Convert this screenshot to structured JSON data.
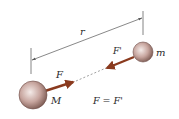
{
  "diagram": {
    "labels": {
      "distance": "r",
      "large_mass": "M",
      "small_mass": "m",
      "force_on_M": "F",
      "force_on_m": "F'",
      "equation": "F = F'"
    },
    "colors": {
      "sphere_fill": "#b08a82",
      "sphere_highlight": "#f4ebe8",
      "sphere_edge": "#6e4e48",
      "arrow": "#8a3a1e",
      "dimension_line": "#555555",
      "text": "#2a2a2a"
    }
  }
}
